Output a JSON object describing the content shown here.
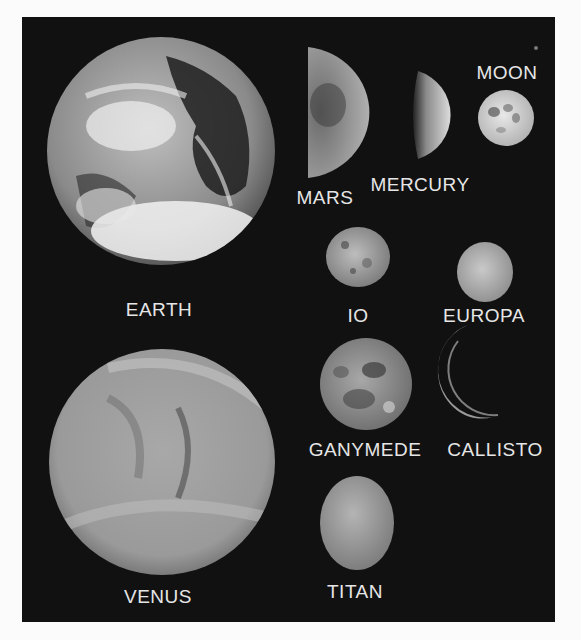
{
  "figure": {
    "background": "#111111",
    "label_color": "#e6e6e6",
    "bodies": [
      {
        "name": "EARTH",
        "label": "EARTH"
      },
      {
        "name": "MARS",
        "label": "MARS"
      },
      {
        "name": "MERCURY",
        "label": "MERCURY"
      },
      {
        "name": "MOON",
        "label": "MOON"
      },
      {
        "name": "IO",
        "label": "IO"
      },
      {
        "name": "EUROPA",
        "label": "EUROPA"
      },
      {
        "name": "GANYMEDE",
        "label": "GANYMEDE"
      },
      {
        "name": "CALLISTO",
        "label": "CALLISTO"
      },
      {
        "name": "VENUS",
        "label": "VENUS"
      },
      {
        "name": "TITAN",
        "label": "TITAN"
      }
    ]
  }
}
